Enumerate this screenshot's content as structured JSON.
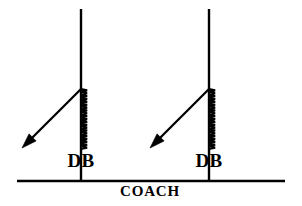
{
  "diagram": {
    "background_color": "#ffffff",
    "stroke_color": "#000000",
    "labels": {
      "defender_left": "DB",
      "defender_right": "DB",
      "coach_line": "COACH"
    },
    "elements": {
      "vertical_line_left_name": "left vertical route line",
      "vertical_line_right_name": "right vertical route line",
      "horizontal_line_name": "coach line of scrimmage",
      "zigzag_left_name": "left squiggle press motion",
      "zigzag_right_name": "right squiggle press motion",
      "arrow_left_name": "left break arrow",
      "arrow_right_name": "right break arrow"
    }
  },
  "geometry": {
    "canvas_width": 302,
    "canvas_height": 206,
    "coach_line": {
      "x1": 17,
      "y1": 181,
      "x2": 285,
      "y2": 181,
      "width": 2.6
    },
    "vertical_lines": [
      {
        "x": 81,
        "y_top": 9,
        "y_bottom": 181,
        "width": 2.4
      },
      {
        "x": 209,
        "y_top": 9,
        "y_bottom": 181,
        "width": 2.4
      }
    ],
    "zigzags": [
      {
        "x": 84,
        "y_top": 89,
        "y_bottom": 149,
        "amplitude": 3.1,
        "cycles": 21,
        "width": 2.2
      },
      {
        "x": 212,
        "y_top": 89,
        "y_bottom": 149,
        "amplitude": 3.1,
        "cycles": 21,
        "width": 2.2
      }
    ],
    "arrows": [
      {
        "x1": 81,
        "y1": 89,
        "x2": 22,
        "y2": 148,
        "width": 2.3,
        "head_length": 15,
        "head_width": 10
      },
      {
        "x1": 209,
        "y1": 89,
        "x2": 150,
        "y2": 148,
        "width": 2.3,
        "head_length": 15,
        "head_width": 10
      }
    ],
    "db_label_positions": [
      {
        "x": 81,
        "y": 151
      },
      {
        "x": 209,
        "y": 151
      }
    ],
    "coach_label_position": {
      "x": 150,
      "y": 184
    }
  }
}
